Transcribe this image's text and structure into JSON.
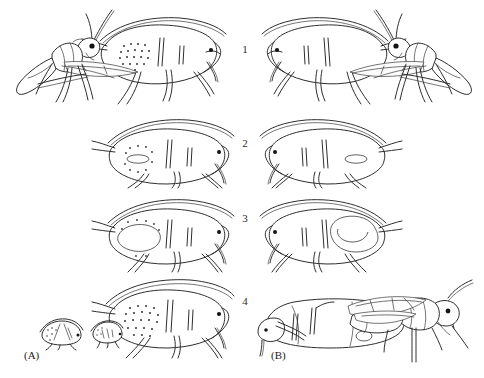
{
  "figure": {
    "background_color": "#ffffff",
    "ink_color": "#2e2e2e",
    "panels": [
      {
        "label": "(A)",
        "label_x": 24,
        "label_y": 355,
        "name": "panel-a"
      },
      {
        "label": "(B)",
        "label_x": 271,
        "label_y": 355,
        "name": "panel-b"
      }
    ],
    "row_numbers": [
      {
        "label": "1",
        "x": 240,
        "y": 44
      },
      {
        "label": "2",
        "x": 240,
        "y": 138
      },
      {
        "label": "3",
        "x": 240,
        "y": 213
      },
      {
        "label": "4",
        "x": 240,
        "y": 296
      }
    ],
    "cells": [
      {
        "name": "cell-a1",
        "row": "1",
        "panel": "(A)",
        "description": "Adult parasitoid wasp facing right, ovipositing into an aphid; aphid abdomen bears a dense field of fine dots"
      },
      {
        "name": "cell-b1",
        "row": "1",
        "panel": "(B)",
        "description": "Mirror image: aphid at left with adult parasitoid wasp approaching from the right, antennae raised"
      },
      {
        "name": "cell-a2",
        "row": "2",
        "panel": "(A)",
        "description": "Aphid facing right with a small pale oval (parasitoid egg) and scattered dots in the abdomen"
      },
      {
        "name": "cell-b2",
        "row": "2",
        "panel": "(B)",
        "description": "Aphid facing left with a small pale oval (parasitoid egg) in the abdomen"
      },
      {
        "name": "cell-a3",
        "row": "3",
        "panel": "(A)",
        "description": "Aphid facing right with an enlarged pale lobed region and dots, showing growing parasitoid larva"
      },
      {
        "name": "cell-b3",
        "row": "3",
        "panel": "(B)",
        "description": "Aphid facing left containing a large kidney-shaped parasitoid larva filling the abdomen"
      },
      {
        "name": "cell-a4",
        "row": "4",
        "panel": "(A)",
        "description": "Large aphid facing right with heavy dot stippling, plus two small mummified aphids at lower left"
      },
      {
        "name": "cell-b4",
        "row": "4",
        "panel": "(B)",
        "description": "Adult parasitoid wasp standing over an empty aphid mummy with a round exit hole"
      }
    ]
  }
}
